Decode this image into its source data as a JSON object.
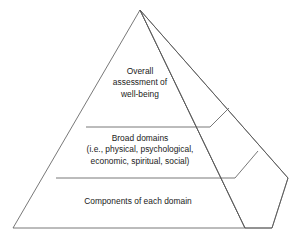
{
  "figure": {
    "type": "pyramid-diagram",
    "orientation": "three-dimensional-right-face",
    "tier_count": 3
  },
  "style": {
    "stroke_color": "#555555",
    "stroke_width": 0.8,
    "fill_color": "#ffffff",
    "text_color": "#1a1a1a",
    "background": "#ffffff"
  },
  "tiers": [
    {
      "id": "top",
      "name": "overall-assessment",
      "label": "Overall\nassessment of\nwell-being"
    },
    {
      "id": "middle",
      "name": "broad-domains",
      "label": "Broad domains\n(i.e., physical, psychological,\neconomic, spiritual, social)"
    },
    {
      "id": "bottom",
      "name": "components",
      "label": "Components of each domain"
    }
  ],
  "geometry": {
    "apex": [
      140,
      10
    ],
    "bottom_left": [
      13,
      228
    ],
    "bottom_front_right": [
      245,
      228
    ],
    "back_right": [
      288,
      178
    ],
    "bottom_back_right": [
      272,
      228
    ],
    "divider_y_upper": 127,
    "divider_y_lower": 178
  }
}
